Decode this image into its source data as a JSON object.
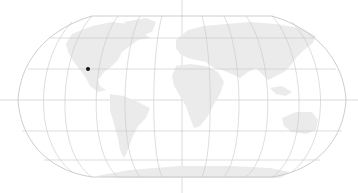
{
  "map": {
    "projection": "robinson",
    "background": "#ffffff",
    "graticule_color": "#c8c8c8",
    "land_color": "#ebebeb",
    "crosshair_color": "#cfcfcf",
    "marker": {
      "color": "#111111",
      "x": 88,
      "y": 69
    }
  }
}
